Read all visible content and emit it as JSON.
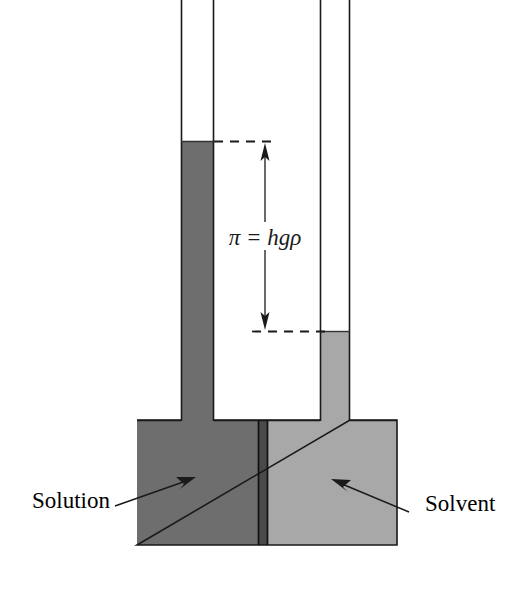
{
  "figure": {
    "background_color": "#ffffff",
    "width": 519,
    "height": 600
  },
  "formula": {
    "text": "π = hgρ",
    "symbol_pi": "π",
    "equals": "=",
    "expression": "hgρ",
    "meaning": "osmotic pressure equals height times gravity times density"
  },
  "labels": {
    "left": {
      "text": "Solution",
      "x": 32,
      "y": 508,
      "arrow_from": [
        115,
        506
      ],
      "arrow_to": [
        193,
        479
      ]
    },
    "right": {
      "text": "Solvent",
      "x": 425,
      "y": 511,
      "arrow_from": [
        409,
        512
      ],
      "arrow_to": [
        335,
        479
      ]
    }
  },
  "colors": {
    "solution_fill": "#6e6e6e",
    "solvent_fill": "#a8a8a8",
    "membrane_fill": "#4a4a4a",
    "outline": "#1a1a1a",
    "dash_line": "#1a1a1a",
    "arrow": "#1a1a1a",
    "text": "#000000",
    "background": "#ffffff"
  },
  "geometry": {
    "reservoir": {
      "x": 137,
      "y": 420,
      "width": 260,
      "height": 125
    },
    "membrane": {
      "x": 258,
      "y": 420,
      "width": 10,
      "height": 125
    },
    "left_tube": {
      "x": 181,
      "width": 33,
      "top": -5,
      "liquid_top": 141
    },
    "right_tube": {
      "x": 320,
      "width": 30,
      "top": -5,
      "liquid_top": 331
    },
    "height_arrow": {
      "x": 265,
      "top": 141,
      "bottom": 331
    },
    "dash_upper": {
      "y": 141,
      "x1": 214,
      "x2": 276
    },
    "dash_lower": {
      "y": 331,
      "x1": 253,
      "x2": 330
    }
  },
  "annotations": {
    "height_difference_label": "h",
    "left_column": "Solution column (raised)",
    "right_column": "Solvent column (lower)",
    "divider": "semipermeable membrane"
  }
}
